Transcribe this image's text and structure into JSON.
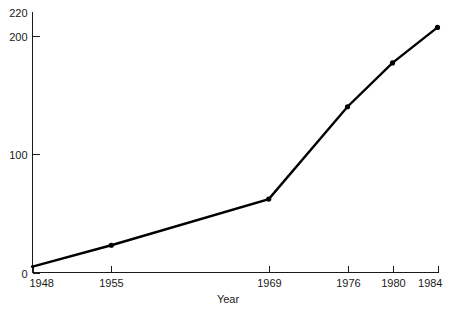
{
  "chart_data": {
    "type": "line",
    "title": "",
    "subtitle": "",
    "xlabel": "Year",
    "ylabel": "",
    "x": [
      1948,
      1955,
      1969,
      1976,
      1980,
      1984
    ],
    "categories": [
      "1948",
      "1955",
      "1969",
      "1976",
      "1980",
      "1984"
    ],
    "values": [
      5,
      23,
      62,
      140,
      177,
      207
    ],
    "series": [
      {
        "name": "",
        "values": [
          5,
          23,
          62,
          140,
          177,
          207
        ]
      }
    ],
    "xtick_labels": [
      "1948",
      "1955",
      "1969",
      "1976",
      "1980",
      "1984"
    ],
    "ytick_labels": [
      "0",
      "100",
      "200",
      "220"
    ],
    "ytick_values": [
      0,
      100,
      200,
      220
    ],
    "xlim": [
      1948,
      1984
    ],
    "ylim": [
      0,
      220
    ],
    "grid": false,
    "legend": "none",
    "markers": "filled-circle",
    "line_color": "#000000",
    "marker_color": "#000000",
    "axis_color": "#1a1a1a",
    "background_color": "#ffffff"
  },
  "axis": {
    "x_title": "Year"
  }
}
